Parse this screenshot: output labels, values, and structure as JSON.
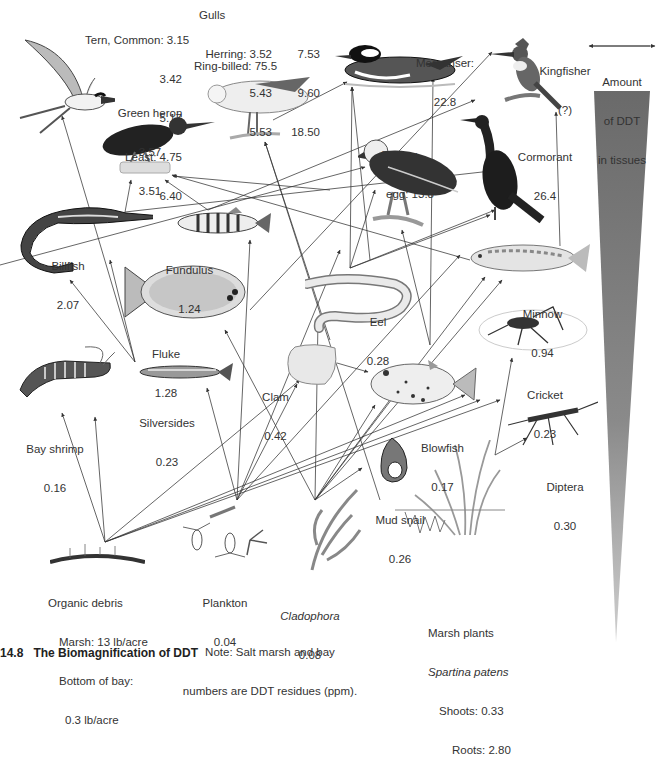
{
  "figure": {
    "caption_number": "14.8",
    "caption_title": "The Biomagnification of DDT",
    "caption_rest": "Higher trophic levels accumulate the most DDT",
    "note_line1": "Note: Salt marsh and bay",
    "note_line2": "numbers are DDT residues (ppm)."
  },
  "scale": {
    "label_line1": "Amount",
    "label_line2": "of DDT",
    "label_line3": "in tissues",
    "gradient_top": "#6a6a6a",
    "gradient_bottom": "#c8c8c8"
  },
  "organisms": {
    "tern": {
      "label": "Tern, Common: 3.15",
      "v2": "3.42",
      "v3": "5.17",
      "least": "Least: 4.75",
      "v5": "6.40"
    },
    "gulls": {
      "title": "Gulls",
      "herring": "Herring: 3.52",
      "h2": "5.43",
      "h3": "5.53",
      "c1": "7.53",
      "c2": "9.60",
      "c3": "18.50",
      "ring": "Ring-billed: 75.5"
    },
    "merganser": {
      "name": "Merganser:",
      "value": "22.8"
    },
    "kingfisher": {
      "name": "Kingfisher",
      "value": "(?)"
    },
    "green_heron": {
      "name": "Green heron",
      "v1": "3.57",
      "v2": "3.51"
    },
    "osprey": {
      "name": "Osprey",
      "value": "egg: 13.8"
    },
    "cormorant": {
      "name": "Cormorant",
      "value": "26.4"
    },
    "billfish": {
      "name": "Billfish",
      "value": "2.07"
    },
    "fundulus": {
      "name": "Fundulus",
      "value": "1.24"
    },
    "fluke": {
      "name": "Fluke",
      "value": "1.28"
    },
    "eel": {
      "name": "Eel",
      "value": "0.28"
    },
    "minnow": {
      "name": "Minnow",
      "value": "0.94"
    },
    "cricket": {
      "name": "Cricket",
      "value": "0.23"
    },
    "bay_shrimp": {
      "name": "Bay shrimp",
      "value": "0.16"
    },
    "silversides": {
      "name": "Silversides",
      "value": "0.23"
    },
    "clam": {
      "name": "Clam",
      "value": "0.42"
    },
    "blowfish": {
      "name": "Blowfish",
      "value": "0.17"
    },
    "diptera": {
      "name": "Diptera",
      "value": "0.30"
    },
    "mud_snail": {
      "name": "Mud snail",
      "value": "0.26"
    },
    "organic_debris": {
      "name": "Organic debris",
      "marsh": "Marsh: 13 lb/acre",
      "bay1": "Bottom of bay:",
      "bay2": "0.3 lb/acre"
    },
    "plankton": {
      "name": "Plankton",
      "value": "0.04"
    },
    "cladophora": {
      "name": "Cladophora",
      "value": "0.08"
    },
    "marsh_plants": {
      "name": "Marsh plants",
      "species": "Spartina patens",
      "shoots": "Shoots: 0.33",
      "roots": "Roots: 2.80"
    }
  }
}
